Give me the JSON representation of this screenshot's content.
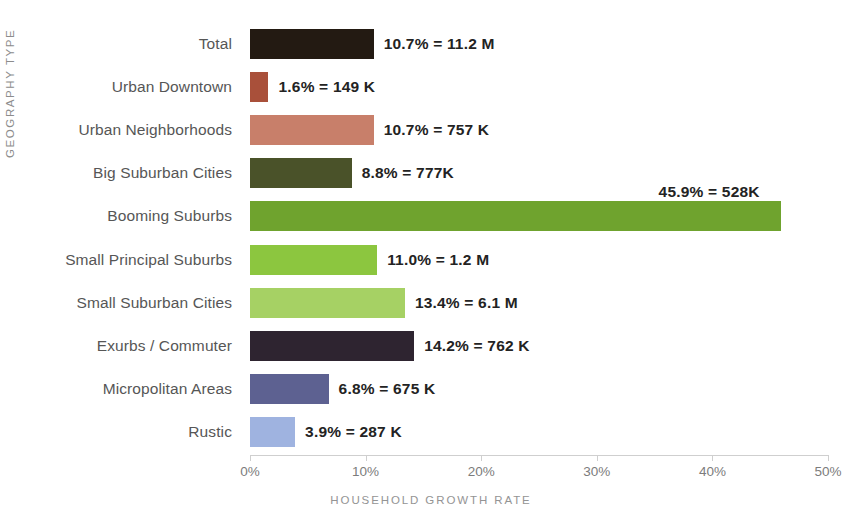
{
  "chart_data": {
    "type": "bar",
    "orientation": "horizontal",
    "title": "",
    "xlabel": "HOUSEHOLD GROWTH RATE",
    "ylabel": "GEOGRAPHY TYPE",
    "xlim": [
      0,
      50
    ],
    "xtick_labels": [
      "0%",
      "10%",
      "20%",
      "30%",
      "40%",
      "50%"
    ],
    "xticks": [
      0,
      10,
      20,
      30,
      40,
      50
    ],
    "grid": false,
    "legend": "none",
    "categories": [
      "Total",
      "Urban Downtown",
      "Urban Neighborhoods",
      "Big Suburban Cities",
      "Booming Suburbs",
      "Small Principal Suburbs",
      "Small Suburban Cities",
      "Exurbs / Commuter",
      "Micropolitan Areas",
      "Rustic"
    ],
    "values": [
      10.7,
      1.6,
      10.7,
      8.8,
      45.9,
      11.0,
      13.4,
      14.2,
      6.8,
      3.9
    ],
    "data_labels": [
      "10.7% = 11.2 M",
      "1.6% = 149 K",
      "10.7% = 757 K",
      "8.8% = 777K",
      "45.9% = 528K",
      "11.0% = 1.2 M",
      "13.4% = 6.1 M",
      "14.2% = 762 K",
      "6.8% = 675 K",
      "3.9% = 287 K"
    ],
    "households": [
      "11.2 M",
      "149 K",
      "757 K",
      "777K",
      "528K",
      "1.2 M",
      "6.1 M",
      "762 K",
      "675 K",
      "287 K"
    ],
    "bar_colors": [
      "#231a12",
      "#a9503a",
      "#c87f6a",
      "#4a5229",
      "#6fa32e",
      "#8cc63f",
      "#a6d164",
      "#2e2430",
      "#5d6191",
      "#9fb3e0"
    ],
    "label_placement": [
      "right",
      "right",
      "right",
      "right",
      "above-right",
      "right",
      "right",
      "right",
      "right",
      "right"
    ]
  },
  "axis_colors": {
    "axis_line": "#cfcfcf",
    "tick_text": "#7c7c7c",
    "axis_title": "#949494",
    "category_text": "#565656",
    "value_text": "#232323"
  }
}
